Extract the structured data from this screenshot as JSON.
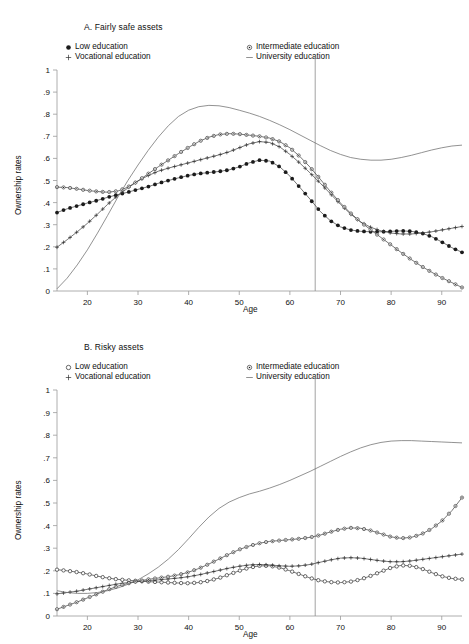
{
  "figure": {
    "ylabel": "Ownership rates",
    "xlabel": "Age",
    "y_ticks": [
      "1",
      ".9",
      ".8",
      ".7",
      ".6",
      ".5",
      ".4",
      ".3",
      ".2",
      ".1",
      "0"
    ],
    "x_ticks": [
      "20",
      "30",
      "40",
      "50",
      "60",
      "70",
      "80",
      "90"
    ],
    "legend": {
      "low": "Low education",
      "vocational": "Vocational education",
      "intermediate": "Intermediate education",
      "university": "University education"
    },
    "markers": {
      "low_a": "filled-circle",
      "low_b": "open-circle",
      "vocational": "plus",
      "intermediate": "ring-dot",
      "university": "plain-line"
    },
    "colors": {
      "line": "#3b3b3b",
      "plain_line": "#6e6e6e",
      "axis": "#9a9a9a",
      "marker_fill": "#1b1b1b",
      "vertical_rule": "#8c8c8c",
      "background": "#ffffff"
    }
  },
  "chart_data": [
    {
      "type": "line",
      "panel": "A",
      "title": "A. Fairly safe assets",
      "xlabel": "Age",
      "ylabel": "Ownership rates",
      "xlim": [
        14,
        94
      ],
      "ylim": [
        0,
        1
      ],
      "grid": false,
      "legend_position": "top",
      "annotations": [
        {
          "type": "vertical-line",
          "x": 65,
          "label": "retirement age"
        }
      ],
      "x": [
        14,
        16,
        18,
        20,
        22,
        24,
        26,
        28,
        30,
        32,
        34,
        36,
        38,
        40,
        42,
        44,
        46,
        48,
        50,
        52,
        54,
        56,
        58,
        60,
        62,
        64,
        66,
        68,
        70,
        72,
        74,
        76,
        78,
        80,
        82,
        84,
        86,
        88,
        90,
        92,
        94
      ],
      "series": [
        {
          "name": "Low education",
          "marker": "filled-circle",
          "values": [
            0.355,
            0.372,
            0.385,
            0.398,
            0.41,
            0.424,
            0.436,
            0.447,
            0.46,
            0.472,
            0.487,
            0.5,
            0.512,
            0.523,
            0.531,
            0.536,
            0.541,
            0.548,
            0.562,
            0.58,
            0.592,
            0.588,
            0.562,
            0.52,
            0.468,
            0.415,
            0.36,
            0.318,
            0.29,
            0.276,
            0.27,
            0.268,
            0.268,
            0.27,
            0.272,
            0.27,
            0.262,
            0.246,
            0.222,
            0.196,
            0.175
          ]
        },
        {
          "name": "Vocational education",
          "marker": "plus",
          "values": [
            0.198,
            0.232,
            0.268,
            0.306,
            0.348,
            0.392,
            0.432,
            0.466,
            0.498,
            0.522,
            0.542,
            0.556,
            0.568,
            0.58,
            0.592,
            0.604,
            0.616,
            0.63,
            0.648,
            0.666,
            0.676,
            0.672,
            0.652,
            0.618,
            0.578,
            0.534,
            0.488,
            0.44,
            0.392,
            0.348,
            0.312,
            0.288,
            0.272,
            0.262,
            0.258,
            0.258,
            0.262,
            0.268,
            0.276,
            0.284,
            0.292
          ]
        },
        {
          "name": "Intermediate education",
          "marker": "ring-dot",
          "values": [
            0.47,
            0.468,
            0.462,
            0.455,
            0.45,
            0.447,
            0.452,
            0.47,
            0.498,
            0.53,
            0.562,
            0.592,
            0.622,
            0.65,
            0.676,
            0.696,
            0.708,
            0.712,
            0.71,
            0.705,
            0.7,
            0.692,
            0.676,
            0.648,
            0.608,
            0.56,
            0.506,
            0.45,
            0.398,
            0.352,
            0.312,
            0.276,
            0.242,
            0.208,
            0.174,
            0.142,
            0.112,
            0.085,
            0.06,
            0.038,
            0.016
          ]
        },
        {
          "name": "University education",
          "marker": "plain-line",
          "values": [
            0.01,
            0.058,
            0.118,
            0.186,
            0.262,
            0.342,
            0.424,
            0.5,
            0.57,
            0.636,
            0.696,
            0.748,
            0.79,
            0.818,
            0.834,
            0.84,
            0.838,
            0.83,
            0.818,
            0.805,
            0.79,
            0.772,
            0.752,
            0.73,
            0.706,
            0.682,
            0.658,
            0.636,
            0.618,
            0.604,
            0.596,
            0.592,
            0.592,
            0.596,
            0.604,
            0.614,
            0.626,
            0.638,
            0.648,
            0.656,
            0.66
          ]
        }
      ]
    },
    {
      "type": "line",
      "panel": "B",
      "title": "B. Risky assets",
      "xlabel": "Age",
      "ylabel": "Ownership rates",
      "xlim": [
        14,
        94
      ],
      "ylim": [
        0,
        1
      ],
      "grid": false,
      "legend_position": "top",
      "annotations": [
        {
          "type": "vertical-line",
          "x": 65,
          "label": "retirement age"
        }
      ],
      "x": [
        14,
        16,
        18,
        20,
        22,
        24,
        26,
        28,
        30,
        32,
        34,
        36,
        38,
        40,
        42,
        44,
        46,
        48,
        50,
        52,
        54,
        56,
        58,
        60,
        62,
        64,
        66,
        68,
        70,
        72,
        74,
        76,
        78,
        80,
        82,
        84,
        86,
        88,
        90,
        92,
        94
      ],
      "series": [
        {
          "name": "Low education",
          "marker": "open-circle",
          "values": [
            0.205,
            0.2,
            0.194,
            0.186,
            0.176,
            0.168,
            0.162,
            0.158,
            0.155,
            0.152,
            0.15,
            0.148,
            0.146,
            0.145,
            0.148,
            0.156,
            0.168,
            0.184,
            0.2,
            0.214,
            0.222,
            0.222,
            0.214,
            0.2,
            0.184,
            0.168,
            0.156,
            0.15,
            0.148,
            0.152,
            0.162,
            0.178,
            0.196,
            0.214,
            0.224,
            0.222,
            0.21,
            0.192,
            0.176,
            0.166,
            0.162
          ]
        },
        {
          "name": "Vocational education",
          "marker": "plus",
          "values": [
            0.098,
            0.104,
            0.11,
            0.118,
            0.126,
            0.134,
            0.142,
            0.148,
            0.152,
            0.156,
            0.16,
            0.164,
            0.168,
            0.174,
            0.182,
            0.192,
            0.202,
            0.212,
            0.22,
            0.226,
            0.228,
            0.226,
            0.222,
            0.22,
            0.222,
            0.228,
            0.238,
            0.248,
            0.256,
            0.258,
            0.256,
            0.25,
            0.244,
            0.24,
            0.24,
            0.244,
            0.25,
            0.256,
            0.262,
            0.268,
            0.274
          ]
        },
        {
          "name": "Intermediate education",
          "marker": "ring-dot",
          "values": [
            0.03,
            0.046,
            0.062,
            0.08,
            0.098,
            0.116,
            0.132,
            0.144,
            0.154,
            0.162,
            0.168,
            0.174,
            0.182,
            0.194,
            0.21,
            0.23,
            0.252,
            0.274,
            0.294,
            0.31,
            0.322,
            0.33,
            0.334,
            0.338,
            0.342,
            0.348,
            0.358,
            0.372,
            0.384,
            0.39,
            0.388,
            0.378,
            0.364,
            0.35,
            0.344,
            0.348,
            0.362,
            0.386,
            0.42,
            0.466,
            0.524
          ]
        },
        {
          "name": "University education",
          "marker": "plain-line",
          "values": [
            0.112,
            0.104,
            0.1,
            0.1,
            0.104,
            0.112,
            0.124,
            0.14,
            0.16,
            0.186,
            0.216,
            0.252,
            0.294,
            0.342,
            0.392,
            0.438,
            0.476,
            0.504,
            0.524,
            0.54,
            0.552,
            0.566,
            0.582,
            0.6,
            0.62,
            0.64,
            0.662,
            0.684,
            0.706,
            0.726,
            0.744,
            0.758,
            0.768,
            0.774,
            0.776,
            0.776,
            0.774,
            0.772,
            0.77,
            0.768,
            0.766
          ]
        }
      ]
    }
  ]
}
